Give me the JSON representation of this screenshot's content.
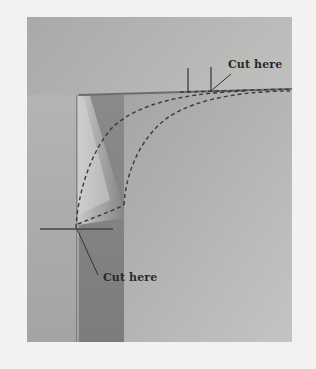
{
  "figure": {
    "type": "photo-diagram",
    "colors": {
      "page_background": "#f2f2f1",
      "photo_wall_light": "#bdbdbc",
      "photo_wall_dark": "#8f8f8e",
      "post_dark": "#838382",
      "shelf_edge": "#6f6f6e",
      "ink": "#333333"
    },
    "annotations": [
      {
        "id": "top-cut",
        "text": "Cut here",
        "position": "top-right"
      },
      {
        "id": "left-cut",
        "text": "Cut here",
        "position": "lower-left"
      }
    ]
  }
}
